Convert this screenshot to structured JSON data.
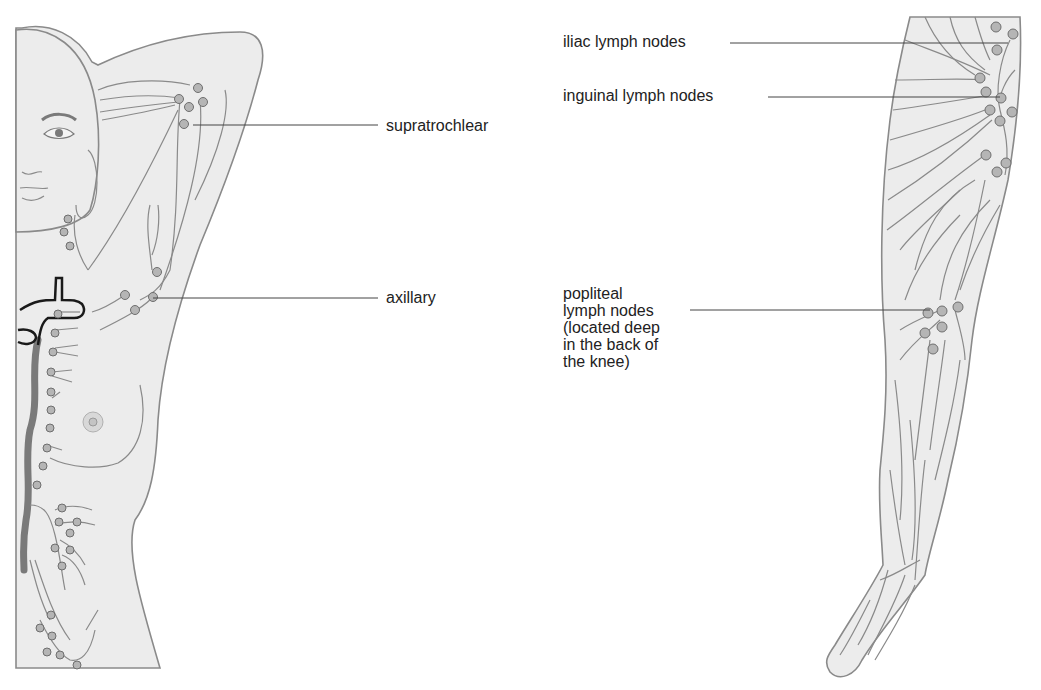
{
  "diagram": {
    "type": "anatomical-illustration",
    "subject": "lymph nodes",
    "colors": {
      "skin_fill": "#ececec",
      "outline": "#8a8a8a",
      "node_fill": "#b5b5b5",
      "label_text": "#222222",
      "leader_line": "#444444",
      "background": "#ffffff"
    },
    "left_figure": {
      "name": "upper-body-with-raised-arm",
      "labels": [
        {
          "id": "supratrochlear",
          "text": "supratrochlear",
          "x": 386,
          "y": 119,
          "line": [
            193,
            125,
            378,
            125
          ]
        },
        {
          "id": "axillary",
          "text": "axillary",
          "x": 386,
          "y": 289,
          "line": [
            153,
            298,
            378,
            298
          ]
        }
      ]
    },
    "right_figure": {
      "name": "leg",
      "labels": [
        {
          "id": "iliac",
          "text": "iliac lymph nodes",
          "x": 563,
          "y": 34,
          "line": [
            730,
            43,
            1008,
            43
          ]
        },
        {
          "id": "inguinal",
          "text": "inguinal lymph nodes",
          "x": 563,
          "y": 87,
          "line": [
            768,
            97,
            1000,
            97
          ]
        },
        {
          "id": "popliteal",
          "text": "popliteal\nlymph nodes\n(located deep\nin the back of\nthe knee)",
          "x": 563,
          "y": 282,
          "line": [
            690,
            310,
            930,
            310
          ]
        }
      ]
    }
  }
}
